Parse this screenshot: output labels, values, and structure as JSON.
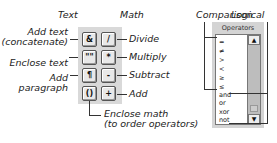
{
  "headers": {
    "text": "Text",
    "math": "Math",
    "comparison": "Comparison",
    "logical": "Logical"
  },
  "text_buttons": [
    {
      "symbol": "&",
      "label": "Add text (concatenate)",
      "label_line1": "Add text",
      "label_line2": "(concatenate)"
    },
    {
      "symbol": "\"\"",
      "label": "Enclose text"
    },
    {
      "symbol": "¶",
      "label": "Add paragraph",
      "label_line1": "Add",
      "label_line2": "paragraph"
    },
    {
      "symbol": "()",
      "label": "Enclose math (to order operators)",
      "label_line1": "Enclose math",
      "label_line2": "(to order operators)"
    }
  ],
  "math_buttons": [
    {
      "symbol": "/",
      "label": "Divide"
    },
    {
      "symbol": "*",
      "label": "Multiply"
    },
    {
      "symbol": "-",
      "label": "Subtract"
    },
    {
      "symbol": "+",
      "label": "Add"
    }
  ],
  "operators": {
    "title": "Operators",
    "comparison_items": [
      "=",
      "≠",
      ">",
      "<",
      "≥",
      "≤"
    ],
    "logical_items": [
      "and",
      "or",
      "xor",
      "not"
    ],
    "scroll_up": "▲",
    "scroll_down": "▼"
  }
}
